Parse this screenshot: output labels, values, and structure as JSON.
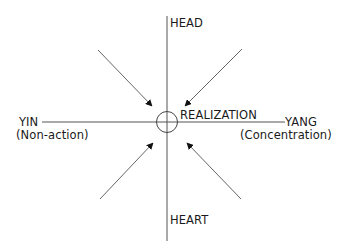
{
  "diagram": {
    "type": "axes-with-converging-arrows",
    "axes": {
      "vertical": {
        "top_label": "HEAD",
        "bottom_label": "HEART"
      },
      "horizontal": {
        "left_label": "YIN",
        "left_sublabel": "(Non-action)",
        "right_label": "YANG",
        "right_sublabel": "(Concentration)"
      }
    },
    "center": {
      "label": "REALIZATION",
      "marker": "circle"
    },
    "arrows": [
      {
        "from": "upper-left",
        "to": "center"
      },
      {
        "from": "upper-right",
        "to": "center"
      },
      {
        "from": "lower-left",
        "to": "center"
      },
      {
        "from": "lower-right",
        "to": "center"
      }
    ],
    "colors": {
      "line": "#555555",
      "arrowhead": "#111111",
      "text": "#1a1a1a",
      "background": "#ffffff"
    }
  }
}
